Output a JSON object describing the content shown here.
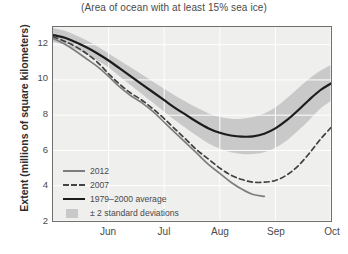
{
  "chart_data": {
    "type": "line",
    "title": "(Area of ocean with at least 15% sea ice)",
    "xlabel": "",
    "ylabel": "Extent (millions of square kilometers)",
    "credit": "National Snow and Ice Data Center, Boulder, CO",
    "grid": true,
    "legend_position": "lower-left-inside",
    "xlim": [
      0,
      5
    ],
    "ylim": [
      2,
      13
    ],
    "yticks": [
      12,
      10,
      8,
      6,
      4,
      2
    ],
    "xticks": [
      {
        "label": "Jun",
        "pos": 1
      },
      {
        "label": "Jul",
        "pos": 2
      },
      {
        "label": "Aug",
        "pos": 3
      },
      {
        "label": "Sep",
        "pos": 4
      },
      {
        "label": "Oct",
        "pos": 5
      }
    ],
    "x_units": "months (mid-May through end of October)",
    "series": [
      {
        "name": "2012",
        "style": "solid",
        "color": "#7d7d7d",
        "x": [
          0.0,
          0.2,
          0.4,
          0.6,
          0.8,
          1.0,
          1.2,
          1.4,
          1.6,
          1.8,
          2.0,
          2.2,
          2.4,
          2.6,
          2.8,
          3.0,
          3.2,
          3.4,
          3.6,
          3.8
        ],
        "y": [
          12.35,
          12.05,
          11.65,
          11.2,
          10.75,
          10.2,
          9.6,
          9.1,
          8.7,
          8.2,
          7.6,
          7.0,
          6.4,
          5.8,
          5.2,
          4.7,
          4.2,
          3.8,
          3.5,
          3.4
        ]
      },
      {
        "name": "2007",
        "style": "dashed",
        "color": "#3f3f3f",
        "x": [
          0.0,
          0.2,
          0.4,
          0.6,
          0.8,
          1.0,
          1.2,
          1.4,
          1.6,
          1.8,
          2.0,
          2.2,
          2.4,
          2.6,
          2.8,
          3.0,
          3.2,
          3.4,
          3.6,
          3.8,
          4.0,
          4.2,
          4.4,
          4.6,
          4.8,
          5.0
        ],
        "y": [
          12.45,
          12.2,
          11.9,
          11.5,
          11.0,
          10.35,
          9.75,
          9.25,
          8.85,
          8.35,
          7.8,
          7.2,
          6.6,
          6.0,
          5.5,
          5.0,
          4.6,
          4.35,
          4.2,
          4.2,
          4.3,
          4.6,
          5.1,
          5.8,
          6.6,
          7.3
        ]
      },
      {
        "name": "1979–2000 average",
        "style": "solid",
        "color": "#1c1c1c",
        "x": [
          0.0,
          0.2,
          0.4,
          0.6,
          0.8,
          1.0,
          1.2,
          1.4,
          1.6,
          1.8,
          2.0,
          2.2,
          2.4,
          2.6,
          2.8,
          3.0,
          3.2,
          3.4,
          3.6,
          3.8,
          4.0,
          4.2,
          4.4,
          4.6,
          4.8,
          5.0
        ],
        "y": [
          12.55,
          12.4,
          12.15,
          11.85,
          11.5,
          11.1,
          10.65,
          10.2,
          9.75,
          9.3,
          8.85,
          8.4,
          8.0,
          7.6,
          7.25,
          7.0,
          6.85,
          6.78,
          6.8,
          6.95,
          7.25,
          7.7,
          8.25,
          8.85,
          9.4,
          9.8
        ]
      }
    ],
    "band": {
      "name": "± 2 standard deviations",
      "color": "#c9c9c9",
      "x": [
        0.0,
        0.2,
        0.4,
        0.6,
        0.8,
        1.0,
        1.2,
        1.4,
        1.6,
        1.8,
        2.0,
        2.2,
        2.4,
        2.6,
        2.8,
        3.0,
        3.2,
        3.4,
        3.6,
        3.8,
        4.0,
        4.2,
        4.4,
        4.6,
        4.8,
        5.0
      ],
      "upper": [
        12.95,
        12.8,
        12.55,
        12.25,
        11.9,
        11.5,
        11.1,
        10.7,
        10.3,
        9.9,
        9.5,
        9.1,
        8.75,
        8.4,
        8.1,
        7.9,
        7.8,
        7.8,
        7.9,
        8.1,
        8.45,
        8.95,
        9.5,
        10.05,
        10.5,
        10.85
      ],
      "lower": [
        12.15,
        12.0,
        11.75,
        11.45,
        11.1,
        10.7,
        10.2,
        9.7,
        9.2,
        8.7,
        8.2,
        7.7,
        7.25,
        6.8,
        6.4,
        6.1,
        5.9,
        5.8,
        5.8,
        5.9,
        6.15,
        6.55,
        7.1,
        7.7,
        8.35,
        8.8
      ]
    }
  },
  "legend": {
    "items": [
      {
        "label": "2012",
        "symbol": "solid-gray-line"
      },
      {
        "label": "2007",
        "symbol": "dashed-line"
      },
      {
        "label": "1979–2000 average",
        "symbol": "solid-black-line"
      },
      {
        "label": "± 2 standard deviations",
        "symbol": "gray-band-swatch"
      }
    ]
  }
}
